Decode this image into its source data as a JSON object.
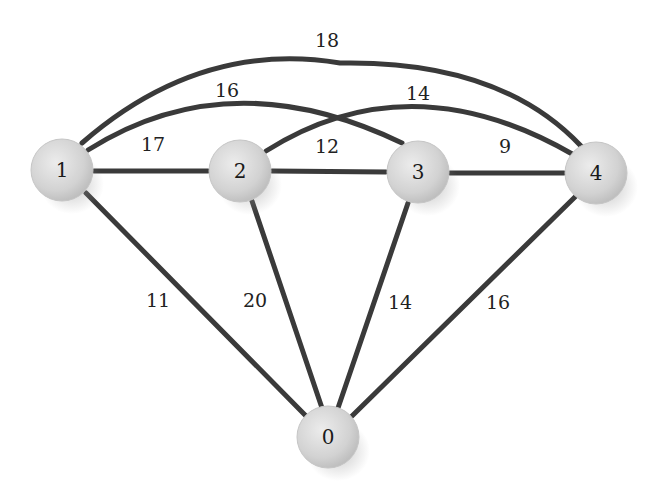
{
  "diagram": {
    "type": "weighted-undirected-graph",
    "nodes": [
      {
        "id": "0",
        "label": "0",
        "x": 328,
        "y": 437
      },
      {
        "id": "1",
        "label": "1",
        "x": 62,
        "y": 170
      },
      {
        "id": "2",
        "label": "2",
        "x": 240,
        "y": 171
      },
      {
        "id": "3",
        "label": "3",
        "x": 418,
        "y": 172
      },
      {
        "id": "4",
        "label": "4",
        "x": 596,
        "y": 173
      }
    ],
    "edges": [
      {
        "from": "1",
        "to": "2",
        "weight": "17",
        "label_x": 153,
        "label_y": 146
      },
      {
        "from": "2",
        "to": "3",
        "weight": "12",
        "label_x": 327,
        "label_y": 148
      },
      {
        "from": "3",
        "to": "4",
        "weight": "9",
        "label_x": 505,
        "label_y": 148
      },
      {
        "from": "1",
        "to": "3",
        "weight": "16",
        "label_x": 227,
        "label_y": 92,
        "curved": true
      },
      {
        "from": "2",
        "to": "4",
        "weight": "14",
        "label_x": 418,
        "label_y": 95,
        "curved": true
      },
      {
        "from": "1",
        "to": "4",
        "weight": "18",
        "label_x": 327,
        "label_y": 42,
        "curved": true
      },
      {
        "from": "1",
        "to": "0",
        "weight": "11",
        "label_x": 158,
        "label_y": 302
      },
      {
        "from": "2",
        "to": "0",
        "weight": "20",
        "label_x": 255,
        "label_y": 302
      },
      {
        "from": "3",
        "to": "0",
        "weight": "14",
        "label_x": 400,
        "label_y": 304
      },
      {
        "from": "4",
        "to": "0",
        "weight": "16",
        "label_x": 498,
        "label_y": 304
      }
    ],
    "colors": {
      "edge": "#3a3a3a",
      "node_fill": "#d4d4d4",
      "node_highlight": "#f2f2f2",
      "text": "#1a1a1a"
    }
  }
}
